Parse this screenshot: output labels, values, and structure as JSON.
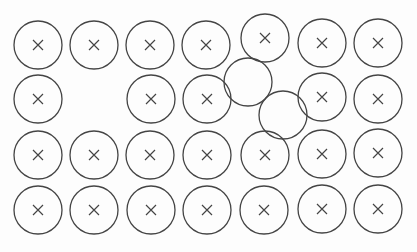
{
  "diagram": {
    "colors": {
      "stroke": "#444444",
      "background": "#fdfdfd"
    },
    "radius": 24,
    "circles": [
      {
        "cx": 38,
        "cy": 45,
        "marked": true
      },
      {
        "cx": 94,
        "cy": 45,
        "marked": true
      },
      {
        "cx": 150,
        "cy": 45,
        "marked": true
      },
      {
        "cx": 206,
        "cy": 45,
        "marked": true
      },
      {
        "cx": 265,
        "cy": 38,
        "marked": true
      },
      {
        "cx": 322,
        "cy": 43,
        "marked": true
      },
      {
        "cx": 378,
        "cy": 43,
        "marked": true
      },
      {
        "cx": 38,
        "cy": 99,
        "marked": true
      },
      {
        "cx": 151,
        "cy": 99,
        "marked": true
      },
      {
        "cx": 207,
        "cy": 99,
        "marked": true
      },
      {
        "cx": 248,
        "cy": 82,
        "marked": false
      },
      {
        "cx": 283,
        "cy": 115,
        "marked": false
      },
      {
        "cx": 322,
        "cy": 97,
        "marked": true
      },
      {
        "cx": 378,
        "cy": 99,
        "marked": true
      },
      {
        "cx": 38,
        "cy": 155,
        "marked": true
      },
      {
        "cx": 94,
        "cy": 155,
        "marked": true
      },
      {
        "cx": 150,
        "cy": 155,
        "marked": true
      },
      {
        "cx": 207,
        "cy": 155,
        "marked": true
      },
      {
        "cx": 265,
        "cy": 155,
        "marked": true
      },
      {
        "cx": 322,
        "cy": 154,
        "marked": true
      },
      {
        "cx": 378,
        "cy": 153,
        "marked": true
      },
      {
        "cx": 38,
        "cy": 210,
        "marked": true
      },
      {
        "cx": 94,
        "cy": 210,
        "marked": true
      },
      {
        "cx": 151,
        "cy": 210,
        "marked": true
      },
      {
        "cx": 207,
        "cy": 210,
        "marked": true
      },
      {
        "cx": 264,
        "cy": 210,
        "marked": true
      },
      {
        "cx": 322,
        "cy": 209,
        "marked": true
      },
      {
        "cx": 378,
        "cy": 209,
        "marked": true
      }
    ]
  }
}
